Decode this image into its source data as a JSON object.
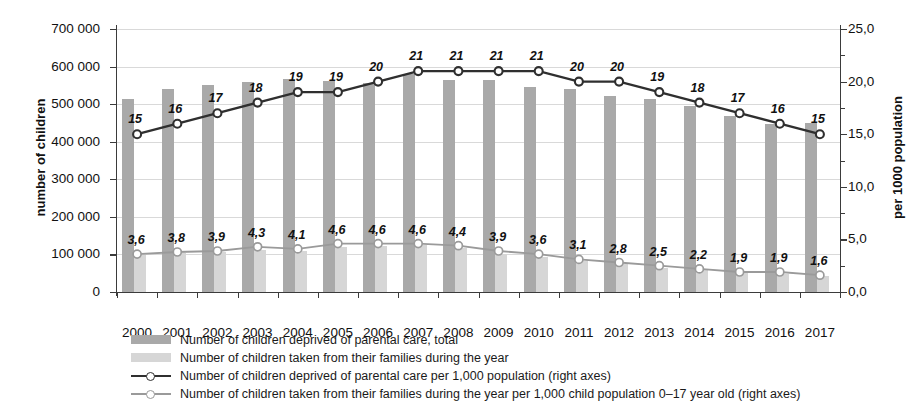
{
  "chart_data": {
    "type": "bar",
    "title": "",
    "subtitle": "",
    "xlabel": "",
    "ylabel": "number of children",
    "ylabel_right": "per 1000 population",
    "grid": true,
    "legend_position": "bottom-left",
    "categories": [
      "2000",
      "2001",
      "2002",
      "2003",
      "2004",
      "2005",
      "2006",
      "2007",
      "2008",
      "2009",
      "2010",
      "2011",
      "2012",
      "2013",
      "2014",
      "2015",
      "2016",
      "2017"
    ],
    "ylim": [
      0,
      700000
    ],
    "ylim_right": [
      0,
      25
    ],
    "yticks": [
      "0",
      "100 000",
      "200 000",
      "300 000",
      "400 000",
      "500 000",
      "600 000",
      "700 000"
    ],
    "ytick_values": [
      0,
      100000,
      200000,
      300000,
      400000,
      500000,
      600000,
      700000
    ],
    "yticks_right": [
      "0,0",
      "5,0",
      "10,0",
      "15,0",
      "20,0",
      "25,0"
    ],
    "ytick_values_right": [
      0,
      5,
      10,
      15,
      20,
      25
    ],
    "series": [
      {
        "name": "Number of children deprived of parental care, total",
        "type": "bar",
        "axis": "left",
        "color": "#a9a9a9",
        "values": [
          513000,
          540000,
          550000,
          560000,
          568000,
          562000,
          556000,
          581000,
          565000,
          565000,
          545000,
          541000,
          521000,
          515000,
          495000,
          468000,
          447000,
          451000
        ]
      },
      {
        "name": "Number of children taken from their families during the year",
        "type": "bar",
        "axis": "left",
        "color": "#d6d6d6",
        "values": [
          98000,
          104000,
          107000,
          112000,
          110000,
          121000,
          122000,
          124000,
          116000,
          102000,
          94000,
          82000,
          74000,
          65000,
          58000,
          50000,
          49000,
          43000
        ]
      },
      {
        "name": "Number of children deprived of parental care per 1,000 population (right axes)",
        "type": "line",
        "axis": "right",
        "color": "#2f2f2f",
        "values": [
          15.0,
          16.0,
          17.0,
          18.0,
          19.0,
          19.0,
          20.0,
          21.0,
          21.0,
          21.0,
          21.0,
          20.0,
          20.0,
          19.0,
          18.0,
          17.0,
          16.0,
          15.0
        ],
        "labels": [
          "15",
          "16",
          "17",
          "18",
          "19",
          "19",
          "20",
          "21",
          "21",
          "21",
          "21",
          "20",
          "20",
          "19",
          "18",
          "17",
          "16",
          "15"
        ]
      },
      {
        "name": "Number of children taken from their families during the year per 1,000 child population 0–17 year old (right axes)",
        "type": "line",
        "axis": "right",
        "color": "#9a9a9a",
        "values": [
          3.6,
          3.8,
          3.9,
          4.3,
          4.1,
          4.6,
          4.6,
          4.6,
          4.4,
          3.9,
          3.6,
          3.1,
          2.8,
          2.5,
          2.2,
          1.9,
          1.9,
          1.6
        ],
        "labels": [
          "3,6",
          "3,8",
          "3,9",
          "4,3",
          "4,1",
          "4,6",
          "4,6",
          "4,6",
          "4,4",
          "3,9",
          "3,6",
          "3,1",
          "2,8",
          "2,5",
          "2,2",
          "1,9",
          "1,9",
          "1,6"
        ]
      }
    ]
  },
  "legend": {
    "items": [
      {
        "label": "Number of children deprived of parental care, total",
        "kind": "swatch",
        "color": "#a9a9a9"
      },
      {
        "label": "Number of children taken from their families during the year",
        "kind": "swatch",
        "color": "#d6d6d6"
      },
      {
        "label": "Number of children deprived of parental care per 1,000 population (right axes)",
        "kind": "line",
        "color": "#2f2f2f"
      },
      {
        "label": "Number of children taken from their families during the year per 1,000 child population 0–17 year old (right axes)",
        "kind": "line",
        "color": "#9a9a9a"
      }
    ]
  }
}
